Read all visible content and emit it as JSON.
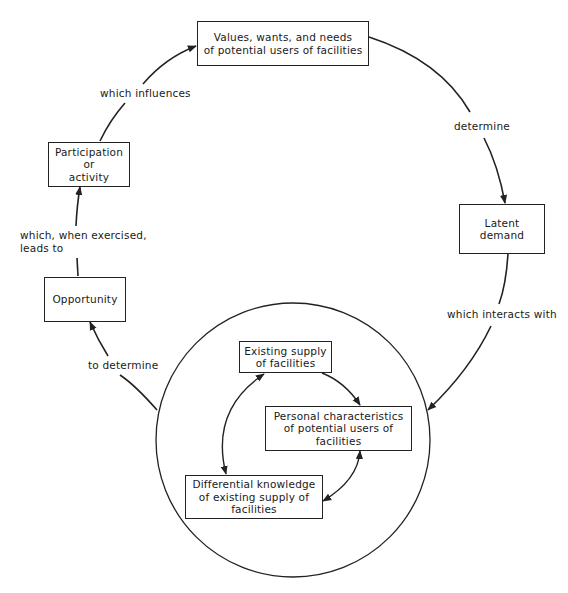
{
  "diagram": {
    "type": "cycle-flowchart",
    "nodes": {
      "values": "Values, wants, and needs\nof potential users of facilities",
      "latent_demand": "Latent demand",
      "participation": "Participation\nor\nactivity",
      "opportunity": "Opportunity",
      "existing_supply": "Existing supply\nof facilities",
      "personal_characteristics": "Personal characteristics\nof potential users of\nfacilities",
      "differential_knowledge": "Differential knowledge\nof existing supply of\nfacilities"
    },
    "edge_labels": {
      "determine": "determine",
      "which_interacts_with": "which interacts with",
      "to_determine": "to determine",
      "which_when_exercised": "which, when exercised,\nleads to",
      "which_influences": "which influences"
    },
    "edges": [
      {
        "from": "values",
        "to": "latent_demand",
        "label": "determine"
      },
      {
        "from": "latent_demand",
        "to": "circle",
        "label": "which interacts with"
      },
      {
        "from": "circle",
        "to": "opportunity",
        "label": "to determine"
      },
      {
        "from": "opportunity",
        "to": "participation",
        "label": "which, when exercised, leads to"
      },
      {
        "from": "participation",
        "to": "values",
        "label": "which influences"
      },
      {
        "from": "existing_supply",
        "to": "personal_characteristics",
        "label": ""
      },
      {
        "from": "existing_supply",
        "to": "differential_knowledge",
        "label": "",
        "bidirectional": true
      },
      {
        "from": "personal_characteristics",
        "to": "differential_knowledge",
        "label": "",
        "bidirectional": true
      }
    ],
    "colors": {
      "stroke": "#222222",
      "background": "#ffffff",
      "text": "#1a1a1a"
    }
  }
}
